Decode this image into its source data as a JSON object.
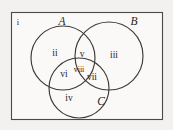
{
  "figure": {
    "type": "venn-diagram-three-sets",
    "background_color": "#f2f1ef",
    "panel_color": "#faf9f7",
    "stroke_color": "#3a3a38"
  },
  "universe": {
    "label": "i",
    "x": 18,
    "y": 25
  },
  "sets": [
    {
      "key": "A",
      "label": "A",
      "cx": 63,
      "cy": 58,
      "r": 32,
      "label_x": 62,
      "label_y": 25
    },
    {
      "key": "B",
      "label": "B",
      "cx": 109,
      "cy": 56,
      "r": 34,
      "label_x": 134,
      "label_y": 25
    },
    {
      "key": "C",
      "label": "C",
      "cx": 79,
      "cy": 88,
      "r": 30,
      "label_x": 101,
      "label_y": 105
    }
  ],
  "regions": [
    {
      "key": "A-only",
      "label": "ii",
      "x": 55,
      "y": 56
    },
    {
      "key": "B-only",
      "label": "iii",
      "x": 114,
      "y": 58
    },
    {
      "key": "C-only",
      "label": "iv",
      "x": 69,
      "y": 101
    },
    {
      "key": "A-and-B",
      "label": "v",
      "x": 82,
      "y": 57
    },
    {
      "key": "A-and-C",
      "label": "vi",
      "x": 64,
      "y": 77
    },
    {
      "key": "B-and-C",
      "label": "vii",
      "x": 92,
      "y": 80
    },
    {
      "key": "A-and-B-and-C",
      "label": "viii",
      "x": 79,
      "y": 72
    }
  ]
}
